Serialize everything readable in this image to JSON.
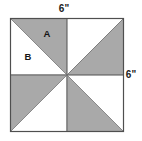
{
  "figure": {
    "shape": "square",
    "colors": {
      "shaded_fill": "#a9a9a9",
      "unshaded_fill": "#ffffff",
      "outline": "#4f4f4f",
      "label_text": "#151515",
      "background": "#ffffff"
    },
    "dimensions": {
      "top_label": "6\"",
      "right_label": "6\"",
      "unit": "inches",
      "side_length": 6
    },
    "region_labels": [
      {
        "id": "A",
        "text": "A",
        "shaded": true,
        "quadrant": "top-left",
        "position": "upper-right half"
      },
      {
        "id": "B",
        "text": "B",
        "shaded": false,
        "quadrant": "top-left",
        "position": "lower-left half"
      }
    ],
    "triangles": [
      {
        "id": "tl-upper",
        "quadrant": "top-left",
        "shaded": true,
        "label": "A"
      },
      {
        "id": "tl-lower",
        "quadrant": "top-left",
        "shaded": false,
        "label": "B"
      },
      {
        "id": "tr-upper",
        "quadrant": "top-right",
        "shaded": false,
        "label": ""
      },
      {
        "id": "tr-lower",
        "quadrant": "top-right",
        "shaded": true,
        "label": ""
      },
      {
        "id": "bl-upper",
        "quadrant": "bottom-left",
        "shaded": true,
        "label": ""
      },
      {
        "id": "bl-lower",
        "quadrant": "bottom-left",
        "shaded": false,
        "label": ""
      },
      {
        "id": "br-upper",
        "quadrant": "bottom-right",
        "shaded": true,
        "label": ""
      },
      {
        "id": "br-lower",
        "quadrant": "bottom-right",
        "shaded": false,
        "label": ""
      }
    ],
    "counts": {
      "total_triangles": 8,
      "shaded_triangles": 4,
      "unshaded_triangles": 4
    }
  }
}
